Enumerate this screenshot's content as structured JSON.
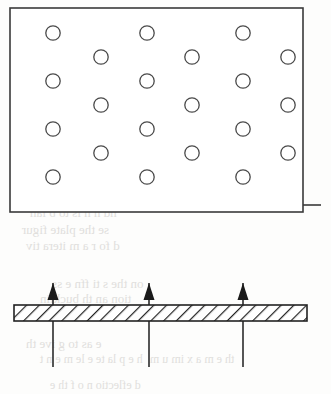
{
  "figure": {
    "panels": [
      {
        "id": "circle-array-panel",
        "name": "rectangular-domain-with-circular-inclusions",
        "rect": {
          "x": 10,
          "y": 8,
          "width": 293,
          "height": 204
        },
        "stroke_color": "#3a3a3a",
        "stroke_width": 1.6,
        "fill_color": "#ffffff",
        "edge_tick": {
          "x1": 303,
          "y1": 205,
          "x2": 321,
          "y2": 205
        },
        "inclusion": {
          "shape": "circle",
          "radius": 7.2,
          "stroke_color": "#4a4a4a",
          "stroke_width": 1.3,
          "fill_color": "none",
          "count": 21,
          "arrangement": "staggered-hexagonal",
          "row_pitch": 23.8,
          "column_pitch": 95
        },
        "circle_centers": [
          {
            "cx": 53,
            "cy": 33
          },
          {
            "cx": 147,
            "cy": 33
          },
          {
            "cx": 243,
            "cy": 33
          },
          {
            "cx": 101,
            "cy": 57
          },
          {
            "cx": 192,
            "cy": 57
          },
          {
            "cx": 288,
            "cy": 57
          },
          {
            "cx": 53,
            "cy": 81
          },
          {
            "cx": 147,
            "cy": 81
          },
          {
            "cx": 243,
            "cy": 81
          },
          {
            "cx": 101,
            "cy": 105
          },
          {
            "cx": 192,
            "cy": 105
          },
          {
            "cx": 288,
            "cy": 105
          },
          {
            "cx": 53,
            "cy": 129
          },
          {
            "cx": 147,
            "cy": 129
          },
          {
            "cx": 243,
            "cy": 129
          },
          {
            "cx": 101,
            "cy": 153
          },
          {
            "cx": 192,
            "cy": 153
          },
          {
            "cx": 288,
            "cy": 153
          },
          {
            "cx": 53,
            "cy": 177
          },
          {
            "cx": 147,
            "cy": 177
          },
          {
            "cx": 243,
            "cy": 177
          }
        ]
      },
      {
        "id": "hatched-beam-panel",
        "name": "hatched-plate-with-load-arrows",
        "bar": {
          "x": 14,
          "y": 305,
          "width": 293,
          "height": 16,
          "stroke_color": "#222222",
          "stroke_width": 1.6,
          "fill_color": "#ffffff",
          "hatch": {
            "pattern": "diagonal-forward-slash",
            "angle_deg": 45,
            "spacing": 9,
            "line_color": "#222222",
            "line_width": 2.2
          }
        },
        "arrows": [
          {
            "x": 53,
            "tip_y": 283,
            "tail_y": 367
          },
          {
            "x": 149,
            "tip_y": 283,
            "tail_y": 367
          },
          {
            "x": 243,
            "tip_y": 283,
            "tail_y": 367
          }
        ],
        "arrow_style": {
          "shaft_color": "#2b2b2b",
          "shaft_width": 1.6,
          "head_color": "#1a1a1a",
          "head_width": 11,
          "head_height": 17,
          "direction": "up"
        }
      }
    ],
    "background_bleedthrough": [
      {
        "text": "PRACTIC",
        "x": 22,
        "y": 150,
        "size": 22,
        "weight": "bold"
      },
      {
        "text": "periodic plate constr",
        "x": 16,
        "y": 186,
        "size": 13,
        "weight": "normal"
      },
      {
        "text": "nd n  h is to  b lan",
        "x": 30,
        "y": 205,
        "size": 13,
        "weight": "normal"
      },
      {
        "text": "se  the  plate  figur",
        "x": 22,
        "y": 222,
        "size": 13,
        "weight": "normal"
      },
      {
        "text": "d  fo r  a  m  itera tiv",
        "x": 26,
        "y": 238,
        "size": 13,
        "weight": "normal"
      },
      {
        "text": "on  the  s ti ffn e ss",
        "x": 52,
        "y": 276,
        "size": 13,
        "weight": "normal"
      },
      {
        "text": "tion  an  th  bucklin",
        "x": 40,
        "y": 291,
        "size": 13,
        "weight": "normal"
      },
      {
        "text": "e  as  to  g ive  th",
        "x": 26,
        "y": 336,
        "size": 13,
        "weight": "normal"
      },
      {
        "text": "h e  p la te  e le m e n t",
        "x": 40,
        "y": 352,
        "size": 12,
        "weight": "normal"
      },
      {
        "text": "th e  m a x im u m",
        "x": 150,
        "y": 352,
        "size": 12,
        "weight": "normal"
      },
      {
        "text": "d eflectio n   o f th e",
        "x": 50,
        "y": 378,
        "size": 12,
        "weight": "normal"
      }
    ]
  }
}
